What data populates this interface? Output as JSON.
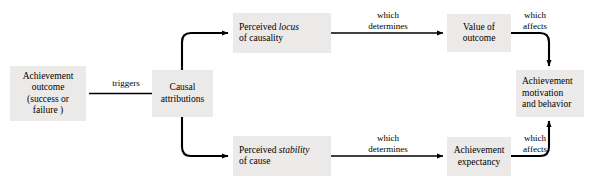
{
  "diagram": {
    "fill_color": "#eceae8",
    "line_color": "#000000",
    "nodes": [
      {
        "id": "achievement-outcome",
        "lines": [
          "Achievement",
          "outcome",
          "(success or",
          "failure )"
        ]
      },
      {
        "id": "causal-attributions",
        "lines": [
          "Causal",
          "attributions"
        ]
      },
      {
        "id": "perceived-locus",
        "lines_html": [
          "Perceived <em>locus</em>",
          "of causality"
        ]
      },
      {
        "id": "value-of-outcome",
        "lines": [
          "Value of",
          "outcome"
        ]
      },
      {
        "id": "perceived-stability",
        "lines_html": [
          "Perceived <em>stability</em>",
          "of cause"
        ]
      },
      {
        "id": "achievement-expectancy",
        "lines": [
          "Achievement",
          "expectancy"
        ]
      },
      {
        "id": "achievement-motivation",
        "lines": [
          "Achievement",
          "motivation",
          "and behavior"
        ]
      }
    ],
    "edge_labels": [
      {
        "id": "triggers",
        "lines": [
          "triggers"
        ]
      },
      {
        "id": "which-determines-top",
        "lines": [
          "which",
          "determines"
        ]
      },
      {
        "id": "which-affects-top",
        "lines": [
          "which",
          "affects"
        ]
      },
      {
        "id": "which-determines-bottom",
        "lines": [
          "which",
          "determines"
        ]
      },
      {
        "id": "which-affects-bottom",
        "lines": [
          "which",
          "affects"
        ]
      }
    ]
  }
}
